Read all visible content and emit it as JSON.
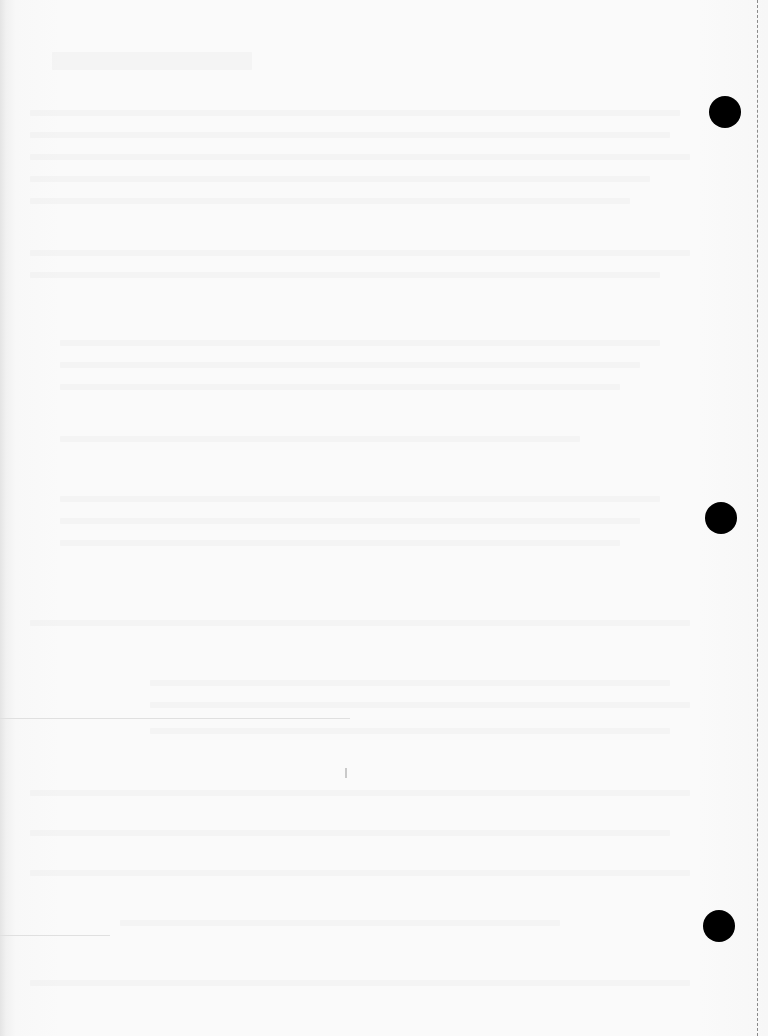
{
  "document": {
    "type": "blank scanned sheet",
    "background_color": "#f9f9f9",
    "binder_holes": [
      {
        "cx": 725,
        "cy": 112,
        "r": 16
      },
      {
        "cx": 721,
        "cy": 518,
        "r": 16
      },
      {
        "cx": 719,
        "cy": 926,
        "r": 16
      }
    ],
    "perforation_line": {
      "x": 757,
      "style": "dashed",
      "color": "#8a8a8a"
    },
    "hole_color": "#000000"
  }
}
